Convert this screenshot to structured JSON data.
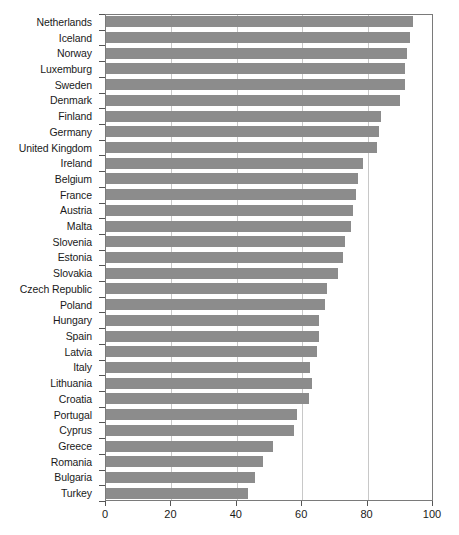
{
  "chart_data": {
    "type": "bar",
    "orientation": "horizontal",
    "title": "",
    "subtitle": "",
    "xlabel": "",
    "ylabel": "",
    "xlim": [
      0,
      100
    ],
    "ylim": null,
    "grid": true,
    "grid_axis": "x",
    "legend": null,
    "legend_position": "none",
    "bar_color": "#8c8c8c",
    "frame_color": "#7a7a7a",
    "gridline_color": "#c8c8c8",
    "categories": [
      "Netherlands",
      "Iceland",
      "Norway",
      "Luxemburg",
      "Sweden",
      "Denmark",
      "Finland",
      "Germany",
      "United Kingdom",
      "Ireland",
      "Belgium",
      "France",
      "Austria",
      "Malta",
      "Slovenia",
      "Estonia",
      "Slovakia",
      "Czech Republic",
      "Poland",
      "Hungary",
      "Spain",
      "Latvia",
      "Italy",
      "Lithuania",
      "Croatia",
      "Portugal",
      "Cyprus",
      "Greece",
      "Romania",
      "Bulgaria",
      "Turkey"
    ],
    "values": [
      94,
      93,
      92,
      91.5,
      91.5,
      90,
      84,
      83.5,
      83,
      78.5,
      77,
      76.5,
      75.5,
      75,
      73,
      72.5,
      71,
      67.5,
      67,
      65,
      65,
      64.5,
      62.5,
      63,
      62,
      58.5,
      57.5,
      51,
      48,
      45.5,
      43.5
    ],
    "xticks": [
      0,
      20,
      40,
      60,
      80,
      100
    ],
    "xtick_labels": [
      "0",
      "20",
      "40",
      "60",
      "80",
      "100"
    ],
    "gridlines": [
      20,
      40,
      60,
      80
    ]
  }
}
